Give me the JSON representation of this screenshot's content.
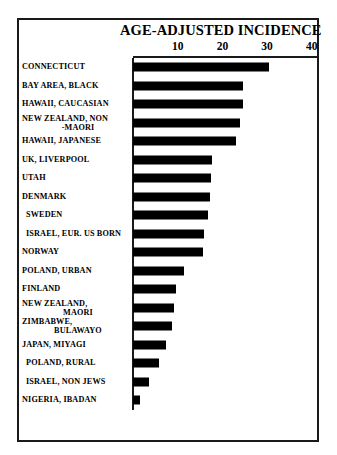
{
  "chart_data": {
    "type": "bar",
    "orientation": "horizontal",
    "title": "AGE-ADJUSTED INCIDENCE",
    "xlabel": "",
    "ylabel": "",
    "xlim": [
      0,
      43
    ],
    "grid": false,
    "legend": null,
    "tick_labels": [
      "10",
      "20",
      "30",
      "40"
    ],
    "tick_values": [
      10,
      20,
      30,
      40
    ],
    "categories": [
      "CONNECTICUT",
      "BAY AREA, BLACK",
      "HAWAII, CAUCASIAN",
      "NEW ZEALAND, NON -MAORI",
      "HAWAII, JAPANESE",
      "UK, LIVERPOOL",
      "UTAH",
      "DENMARK",
      "SWEDEN",
      "ISRAEL, EUR. US BORN",
      "NORWAY",
      "POLAND, URBAN",
      "FINLAND",
      "NEW ZEALAND, MAORI",
      "ZIMBABWE, BULAWAYO",
      "JAPAN, MIYAGI",
      "POLAND, RURAL",
      "ISRAEL, NON JEWS",
      "NIGERIA, IBADAN"
    ],
    "values": [
      30.4,
      24.6,
      24.6,
      23.9,
      23.0,
      17.7,
      17.5,
      17.2,
      16.8,
      15.9,
      15.7,
      11.4,
      9.6,
      9.2,
      8.7,
      7.4,
      5.8,
      3.6,
      1.6
    ]
  },
  "rows": [
    {
      "label": "CONNECTICUT",
      "line1": "CONNECTICUT",
      "line2": "",
      "value": 30.4,
      "indent": false
    },
    {
      "label": "BAY AREA, BLACK",
      "line1": "BAY AREA, BLACK",
      "line2": "",
      "value": 24.6,
      "indent": false
    },
    {
      "label": "HAWAII, CAUCASIAN",
      "line1": "HAWAII, CAUCASIAN",
      "line2": "",
      "value": 24.6,
      "indent": false
    },
    {
      "label": "NEW ZEALAND, NON -MAORI",
      "line1": "NEW ZEALAND, NON",
      "line2": "-MAORI",
      "value": 23.9,
      "indent": false
    },
    {
      "label": "HAWAII, JAPANESE",
      "line1": "HAWAII, JAPANESE",
      "line2": "",
      "value": 23.0,
      "indent": false
    },
    {
      "label": "UK, LIVERPOOL",
      "line1": "UK, LIVERPOOL",
      "line2": "",
      "value": 17.7,
      "indent": false
    },
    {
      "label": "UTAH",
      "line1": "UTAH",
      "line2": "",
      "value": 17.5,
      "indent": false
    },
    {
      "label": "DENMARK",
      "line1": "DENMARK",
      "line2": "",
      "value": 17.2,
      "indent": false
    },
    {
      "label": "SWEDEN",
      "line1": "SWEDEN",
      "line2": "",
      "value": 16.8,
      "indent": true
    },
    {
      "label": "ISRAEL, EUR. US BORN",
      "line1": "ISRAEL, EUR. US BORN",
      "line2": "",
      "value": 15.9,
      "indent": true
    },
    {
      "label": "NORWAY",
      "line1": "NORWAY",
      "line2": "",
      "value": 15.7,
      "indent": false
    },
    {
      "label": "POLAND, URBAN",
      "line1": "POLAND, URBAN",
      "line2": "",
      "value": 11.4,
      "indent": false
    },
    {
      "label": "FINLAND",
      "line1": "FINLAND",
      "line2": "",
      "value": 9.6,
      "indent": false
    },
    {
      "label": "NEW ZEALAND, MAORI",
      "line1": "NEW ZEALAND,",
      "line2": "MAORI",
      "value": 9.2,
      "indent": false
    },
    {
      "label": "ZIMBABWE, BULAWAYO",
      "line1": "ZIMBABWE,",
      "line2": "BULAWAYO",
      "value": 8.7,
      "indent": false
    },
    {
      "label": "JAPAN, MIYAGI",
      "line1": "JAPAN, MIYAGI",
      "line2": "",
      "value": 7.4,
      "indent": false
    },
    {
      "label": "POLAND, RURAL",
      "line1": "POLAND, RURAL",
      "line2": "",
      "value": 5.8,
      "indent": true
    },
    {
      "label": "ISRAEL, NON JEWS",
      "line1": "ISRAEL, NON JEWS",
      "line2": "",
      "value": 3.6,
      "indent": true
    },
    {
      "label": "NIGERIA, IBADAN",
      "line1": "NIGERIA, IBADAN",
      "line2": "",
      "value": 1.6,
      "indent": false
    }
  ],
  "colors": {
    "bar": "#000000",
    "frame": "#1a1a1a",
    "background": "#ffffff",
    "text": "#000000"
  },
  "geometry": {
    "axis_origin_x": 133,
    "px_per_unit": 4.47,
    "first_row_top": 58,
    "row_pitch": 18.5,
    "bar_height": 9
  }
}
